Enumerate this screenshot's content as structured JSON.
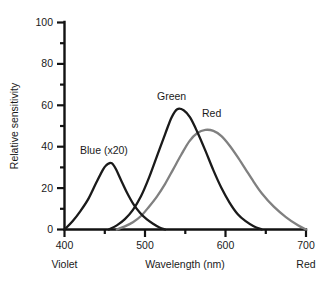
{
  "chart_data": {
    "type": "line",
    "title": "",
    "xlabel": "Wavelength (nm)",
    "ylabel": "Relative sensitivity",
    "xlim": [
      400,
      700
    ],
    "ylim": [
      0,
      100
    ],
    "grid": false,
    "legend_position": "inline-annotations",
    "x_ticks_major": [
      400,
      500,
      600,
      700
    ],
    "x_ticks_minor": [
      450,
      550,
      650
    ],
    "y_ticks_major": [
      0,
      20,
      40,
      60,
      80,
      100
    ],
    "y_ticks_minor": [
      10,
      30,
      50,
      70,
      90
    ],
    "x_tick_labels": [
      "400",
      "500",
      "600",
      "700"
    ],
    "y_tick_labels": [
      "0",
      "20",
      "40",
      "60",
      "80",
      "100"
    ],
    "axis_end_labels": {
      "left": "Violet",
      "right": "Red"
    },
    "series": [
      {
        "name": "Blue (x20)",
        "color": "#1a1a1a",
        "peak_x": 458,
        "peak_y": 32,
        "x": [
          400,
          410,
          420,
          430,
          440,
          448,
          452,
          456,
          458,
          460,
          464,
          470,
          478,
          486,
          494,
          502,
          510,
          518,
          525
        ],
        "values": [
          0,
          4,
          9,
          15,
          23,
          29,
          31,
          32,
          32,
          31.5,
          29,
          24,
          17.5,
          12,
          8,
          5,
          2.8,
          1.0,
          0
        ]
      },
      {
        "name": "Green",
        "color": "#1a1a1a",
        "peak_x": 540,
        "peak_y": 58,
        "x": [
          455,
          465,
          475,
          485,
          495,
          505,
          515,
          525,
          533,
          540,
          548,
          556,
          565,
          575,
          585,
          595,
          605,
          615,
          625,
          635,
          645
        ],
        "values": [
          0,
          2,
          5,
          9.5,
          16,
          25,
          35.5,
          46,
          54,
          58,
          57.5,
          54,
          47,
          38,
          28.5,
          20,
          13,
          7.5,
          4,
          1.6,
          0
        ]
      },
      {
        "name": "Red",
        "color": "#808080",
        "peak_x": 575,
        "peak_y": 48,
        "x": [
          465,
          475,
          485,
          495,
          505,
          515,
          525,
          535,
          545,
          555,
          565,
          575,
          585,
          595,
          605,
          615,
          625,
          635,
          645,
          660,
          675,
          690,
          700
        ],
        "values": [
          0,
          1.5,
          3.5,
          6.5,
          11,
          16,
          22,
          29,
          36,
          42.5,
          46.5,
          48,
          47.5,
          45,
          40.5,
          35,
          29,
          23,
          17.5,
          11,
          6,
          2,
          0
        ]
      }
    ],
    "annotations": [
      {
        "text": "Blue (x20)",
        "x_px": 80,
        "y_px": 154
      },
      {
        "text": "Green",
        "x_px": 157,
        "y_px": 100
      },
      {
        "text": "Red",
        "x_px": 202,
        "y_px": 117
      }
    ]
  }
}
